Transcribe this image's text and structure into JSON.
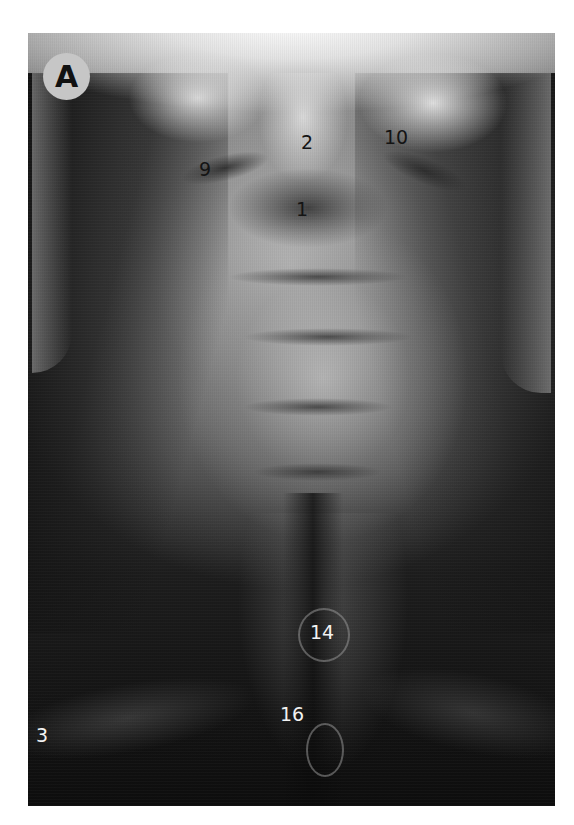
{
  "figure": {
    "panel_label": "A",
    "image_type": "AP cervical spine radiograph",
    "labels": [
      {
        "text": "9",
        "x": 206,
        "y": 171,
        "color": "dark"
      },
      {
        "text": "2",
        "x": 308,
        "y": 144,
        "color": "dark"
      },
      {
        "text": "10",
        "x": 396,
        "y": 139,
        "color": "dark"
      },
      {
        "text": "1",
        "x": 302,
        "y": 210,
        "color": "dark"
      },
      {
        "text": "14",
        "x": 322,
        "y": 634,
        "color": "light"
      },
      {
        "text": "16",
        "x": 291,
        "y": 716,
        "color": "light"
      },
      {
        "text": "3",
        "x": 41,
        "y": 737,
        "color": "light"
      }
    ]
  }
}
